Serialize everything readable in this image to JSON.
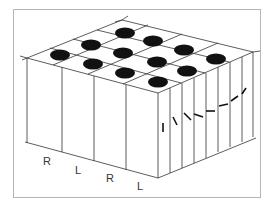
{
  "figure": {
    "labels": [
      "R",
      "L",
      "R",
      "L"
    ],
    "colors": {
      "stroke": "#333333",
      "hole": "#111111",
      "frame": "#b5b5b5",
      "background": "#ffffff"
    }
  }
}
